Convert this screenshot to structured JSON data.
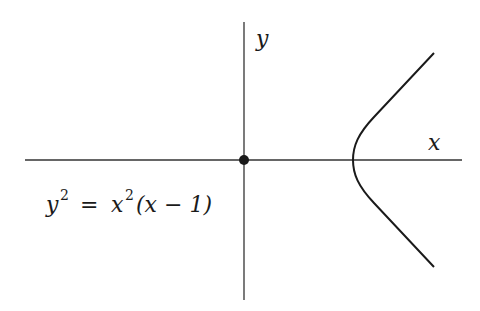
{
  "diagram": {
    "title": "",
    "axes": {
      "x_label": "x",
      "y_label": "y"
    },
    "equation": {
      "lhs_var": "y",
      "lhs_exp": "2",
      "equals": "=",
      "rhs_var": "x",
      "rhs_exp": "2",
      "rhs_paren": "(x − 1)"
    },
    "points": [
      {
        "name": "origin",
        "x": 0,
        "y": 0,
        "style": "filled-dot"
      }
    ],
    "curve": {
      "description": "Cubic curve with isolated point at origin; branch opening right with vertex at (1,0)",
      "vertex": [
        1,
        0
      ]
    },
    "colors": {
      "stroke": "#1a1a1a",
      "axis": "#333333",
      "background": "#ffffff"
    }
  }
}
